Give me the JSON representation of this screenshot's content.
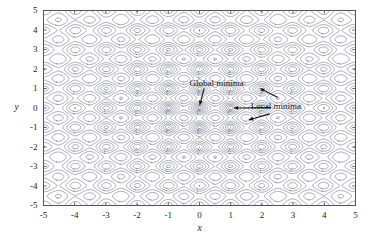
{
  "chart_data": {
    "type": "contour",
    "title": "",
    "xlabel": "x",
    "ylabel": "y",
    "xlim": [
      -5,
      5
    ],
    "ylim": [
      -5,
      5
    ],
    "xticks": [
      "-5",
      "-4",
      "-3",
      "-2",
      "-1",
      "0",
      "1",
      "2",
      "3",
      "4",
      "5"
    ],
    "xtick_values": [
      -5,
      -4,
      -3,
      -2,
      -1,
      0,
      1,
      2,
      3,
      4,
      5
    ],
    "yticks": [
      "5",
      "4",
      "3",
      "2",
      "1",
      "0",
      "-1",
      "-2",
      "-3",
      "-4",
      "-5"
    ],
    "ytick_values": [
      5,
      4,
      3,
      2,
      1,
      0,
      -1,
      -2,
      -3,
      -4,
      -5
    ],
    "grid": false,
    "legend": "none",
    "function": "rastrigin",
    "function_description": "20 + x^2 + y^2 - 10*(cos(2*pi*x) + cos(2*pi*y))",
    "contour_levels": [
      0.6,
      2,
      4,
      7,
      11,
      16,
      22,
      29,
      37,
      46,
      56,
      67,
      79
    ],
    "line_color": "#6f6f86",
    "line_width": 0.6,
    "frame_color": "#555555",
    "global_minimum": {
      "x": 0,
      "y": 0,
      "value": 0
    },
    "local_minima": [
      {
        "x": 1,
        "y": 0
      },
      {
        "x": 2,
        "y": 1
      },
      {
        "x": 1.6,
        "y": -0.6
      }
    ],
    "annotations": [
      {
        "id": "global-minima",
        "label": "Global minima",
        "label_x": 0.55,
        "label_y": 1.25,
        "arrows": [
          {
            "from_x": 0.15,
            "from_y": 1.0,
            "to_x": 0.0,
            "to_y": 0.12
          }
        ]
      },
      {
        "id": "local-minima",
        "label": "Local minima",
        "label_x": 2.45,
        "label_y": 0.05,
        "arrows": [
          {
            "from_x": 2.5,
            "from_y": 0.55,
            "to_x": 1.92,
            "to_y": 1.02
          },
          {
            "from_x": 2.3,
            "from_y": 0.02,
            "to_x": 1.08,
            "to_y": 0.0
          },
          {
            "from_x": 2.25,
            "from_y": -0.3,
            "to_x": 1.56,
            "to_y": -0.62
          }
        ]
      }
    ]
  },
  "axes": {
    "x_title": "x",
    "y_title": "y"
  }
}
